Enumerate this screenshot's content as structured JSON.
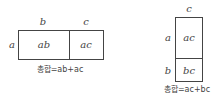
{
  "left": {
    "top_labels": [
      "b",
      "c"
    ],
    "side_label": "a",
    "cells": [
      "ab",
      "ac"
    ],
    "caption": "총합=ab+ac"
  },
  "right": {
    "top_label": "c",
    "side_labels": [
      "a",
      "b"
    ],
    "cells": [
      "ac",
      "bc"
    ],
    "caption": "총합=ac+bc"
  }
}
